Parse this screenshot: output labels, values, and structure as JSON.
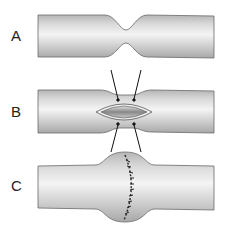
{
  "figure": {
    "panels": [
      {
        "label": "A",
        "description": "Vessel with stenosis (narrowing)"
      },
      {
        "label": "B",
        "description": "Longitudinal incision with spreading arrows"
      },
      {
        "label": "C",
        "description": "Transverse suture closure widening lumen"
      }
    ]
  },
  "colors": {
    "tube_edge": "#6a6a6a",
    "tube_light": "#f2f2f2",
    "tube_mid": "#c8c8c8",
    "arrow": "#111111",
    "suture": "#222222"
  }
}
